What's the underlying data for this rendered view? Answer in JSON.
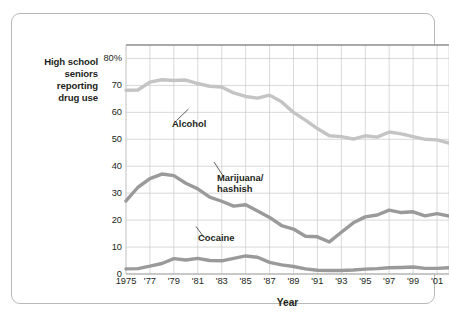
{
  "figure": {
    "y_axis_caption": "High school\nseniors\nreporting\ndrug use",
    "x_axis_title": "Year",
    "border_color": "#b9b9b9",
    "text_color": "#231f20",
    "grid_color": "#c9c9c9",
    "background": "#ffffff"
  },
  "chart_data": {
    "type": "line",
    "title": "",
    "subtitle": "",
    "xlabel": "Year",
    "ylabel": "High school seniors reporting drug use",
    "xlim": [
      1975,
      2002
    ],
    "ylim": [
      0,
      85
    ],
    "grid": true,
    "legend_position": "inline-annotations",
    "y_ticks": [
      0,
      10,
      20,
      30,
      40,
      50,
      60,
      70,
      80
    ],
    "y_tick_labels": [
      "0",
      "10",
      "20",
      "30",
      "40",
      "50",
      "60",
      "70",
      "80%"
    ],
    "x_ticks": [
      1975,
      1977,
      1979,
      1981,
      1983,
      1985,
      1987,
      1989,
      1991,
      1993,
      1995,
      1997,
      1999,
      2001
    ],
    "x_tick_labels": [
      "1975",
      "'77",
      "'79",
      "'81",
      "'83",
      "'85",
      "'87",
      "'89",
      "'91",
      "'93",
      "'95",
      "'97",
      "'99",
      "'01"
    ],
    "x": [
      1975,
      1976,
      1977,
      1978,
      1979,
      1980,
      1981,
      1982,
      1983,
      1984,
      1985,
      1986,
      1987,
      1988,
      1989,
      1990,
      1991,
      1992,
      1993,
      1994,
      1995,
      1996,
      1997,
      1998,
      1999,
      2000,
      2001,
      2002
    ],
    "series": [
      {
        "name": "Alcohol",
        "color": "#c4c4c4",
        "label": "Alcohol",
        "values": [
          68.2,
          68.3,
          71.2,
          72.1,
          71.8,
          72.0,
          70.7,
          69.7,
          69.4,
          67.2,
          65.9,
          65.3,
          66.4,
          63.9,
          60.0,
          57.1,
          54.0,
          51.3,
          51.0,
          50.1,
          51.3,
          50.8,
          52.7,
          52.0,
          51.0,
          50.0,
          49.8,
          48.6
        ]
      },
      {
        "name": "Marijuana/hashish",
        "color": "#9a9a9a",
        "label": "Marijuana/\nhashish",
        "values": [
          27.1,
          32.2,
          35.4,
          37.1,
          36.5,
          33.7,
          31.6,
          28.5,
          27.0,
          25.2,
          25.7,
          23.4,
          21.0,
          18.0,
          16.7,
          14.0,
          13.8,
          11.9,
          15.5,
          19.0,
          21.2,
          21.9,
          23.7,
          22.8,
          23.1,
          21.6,
          22.4,
          21.5
        ]
      },
      {
        "name": "Cocaine",
        "color": "#9a9a9a",
        "label": "Cocaine",
        "values": [
          1.9,
          2.0,
          2.9,
          3.9,
          5.7,
          5.2,
          5.8,
          5.0,
          4.9,
          5.8,
          6.7,
          6.2,
          4.3,
          3.4,
          2.8,
          1.9,
          1.4,
          1.3,
          1.3,
          1.5,
          1.8,
          2.0,
          2.3,
          2.4,
          2.6,
          2.1,
          2.1,
          2.3
        ]
      }
    ]
  }
}
